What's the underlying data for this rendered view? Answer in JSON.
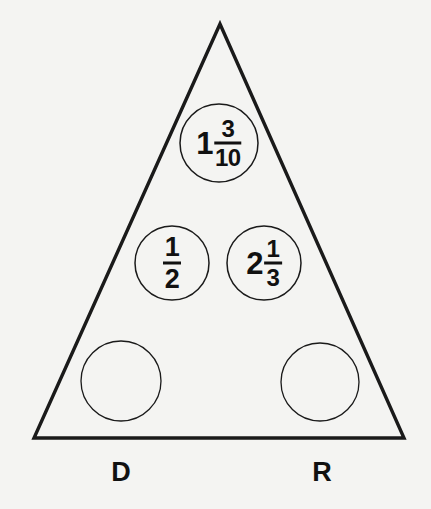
{
  "figure": {
    "background_color": "#f4f4f2",
    "line_color": "#1a1a1a",
    "text_color": "#111111"
  },
  "triangle": {
    "apex": {
      "x": 220,
      "y": 24
    },
    "bottom_left": {
      "x": 34,
      "y": 438
    },
    "bottom_right": {
      "x": 404,
      "y": 438
    }
  },
  "slots": [
    {
      "id": "top",
      "position": "top-center",
      "cx": 219,
      "cy": 143,
      "r": 39,
      "filled": true,
      "whole": "1",
      "numerator": "3",
      "denominator": "10",
      "display": "1 3/10"
    },
    {
      "id": "middle-left",
      "position": "middle-left",
      "cx": 172,
      "cy": 263,
      "r": 37,
      "filled": true,
      "whole": "",
      "numerator": "1",
      "denominator": "2",
      "display": "1/2"
    },
    {
      "id": "middle-right",
      "position": "middle-right",
      "cx": 264,
      "cy": 263,
      "r": 37,
      "filled": true,
      "whole": "2",
      "numerator": "1",
      "denominator": "3",
      "display": "2 1/3"
    },
    {
      "id": "bottom-left",
      "position": "bottom-left",
      "cx": 121,
      "cy": 381,
      "r": 40,
      "filled": false,
      "whole": "",
      "numerator": "",
      "denominator": "",
      "display": ""
    },
    {
      "id": "bottom-right",
      "position": "bottom-right",
      "cx": 320,
      "cy": 382,
      "r": 39,
      "filled": false,
      "whole": "",
      "numerator": "",
      "denominator": "",
      "display": ""
    }
  ],
  "corner_labels": [
    {
      "id": "label-d",
      "text": "D",
      "x": 121,
      "y": 481
    },
    {
      "id": "label-r",
      "text": "R",
      "x": 322,
      "y": 481
    }
  ]
}
